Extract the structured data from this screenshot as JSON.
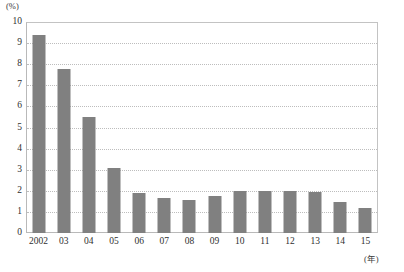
{
  "chart_data": {
    "type": "bar",
    "title": "",
    "subtitle": "",
    "xlabel": "(年)",
    "ylabel": "(%)",
    "categories": [
      "2002",
      "03",
      "04",
      "05",
      "06",
      "07",
      "08",
      "09",
      "10",
      "11",
      "12",
      "13",
      "14",
      "15"
    ],
    "values": [
      9.4,
      7.75,
      5.5,
      3.1,
      1.9,
      1.65,
      1.55,
      1.75,
      2.0,
      2.0,
      2.0,
      1.95,
      1.45,
      1.2
    ],
    "ylim": [
      0,
      10
    ],
    "xlim": null,
    "y_ticks": [
      "10",
      "9",
      "8",
      "7",
      "6",
      "5",
      "4",
      "3",
      "2",
      "1",
      "0"
    ],
    "y_tick_values": [
      10,
      9,
      8,
      7,
      6,
      5,
      4,
      3,
      2,
      1,
      0
    ],
    "grid": true,
    "grid_orientation": "horizontal",
    "grid_style": "dotted",
    "legend": false,
    "legend_position": "none",
    "annotations": [],
    "series": [
      {
        "name": "",
        "values": [
          9.4,
          7.75,
          5.5,
          3.1,
          1.9,
          1.65,
          1.55,
          1.75,
          2.0,
          2.0,
          2.0,
          1.95,
          1.45,
          1.2
        ]
      }
    ]
  },
  "colors": {
    "bar": "#808080",
    "gridline": "#bdbdbd",
    "axis_border": "#b9b9b9",
    "text": "#2f2f2f",
    "background": "#ffffff"
  },
  "axes": {
    "y_unit": "(%)",
    "x_unit": "(年)"
  }
}
